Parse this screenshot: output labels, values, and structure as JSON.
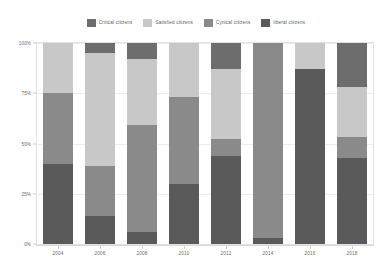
{
  "chart_data": {
    "type": "bar",
    "subtype": "100% stacked bar",
    "title": "",
    "xlabel": "",
    "ylabel": "",
    "categories": [
      "2004",
      "2006",
      "2008",
      "2010",
      "2012",
      "2014",
      "2016",
      "2018"
    ],
    "ylim": [
      0,
      100
    ],
    "yticks": [
      "0%",
      "25%",
      "50%",
      "75%",
      "100%"
    ],
    "ytick_values": [
      0,
      25,
      50,
      75,
      100
    ],
    "grid": true,
    "legend_position": "top-center",
    "stack_order_bottom_to_top": [
      "liberal citizens",
      "Cynical citizens",
      "Satisfied citizens",
      "Critical citizens"
    ],
    "series": [
      {
        "name": "Critical citizens",
        "color": "#6d6d6d",
        "values": [
          0,
          5,
          8,
          0,
          13,
          0,
          0,
          22
        ]
      },
      {
        "name": "Satisfied citizens",
        "color": "#c8c8c8",
        "values": [
          25,
          56,
          33,
          27,
          35,
          0,
          13,
          25
        ]
      },
      {
        "name": "Cynical citizens",
        "color": "#8a8a8a",
        "values": [
          35,
          25,
          53,
          43,
          8,
          97,
          0,
          10
        ]
      },
      {
        "name": "liberal citizens",
        "color": "#5a5a5a",
        "values": [
          40,
          14,
          6,
          30,
          44,
          3,
          87,
          43
        ]
      }
    ]
  },
  "legend": {
    "items": [
      {
        "label": "Critical citizens",
        "color": "#6d6d6d"
      },
      {
        "label": "Satisfied citizens",
        "color": "#c8c8c8"
      },
      {
        "label": "Cynical citizens",
        "color": "#8a8a8a"
      },
      {
        "label": "liberal citizens",
        "color": "#5a5a5a"
      }
    ]
  },
  "axes": {
    "y_ticks": [
      "100%",
      "75%",
      "50%",
      "25%",
      "0%"
    ],
    "x_ticks": [
      "2004",
      "2006",
      "2008",
      "2010",
      "2012",
      "2014",
      "2016",
      "2018"
    ]
  },
  "colors": {
    "background": "#ffffff",
    "grid": "#ededed",
    "frame": "#e2e2e2",
    "tick_text": "#6a6a6a",
    "legend_text": "#5d5d5d"
  }
}
